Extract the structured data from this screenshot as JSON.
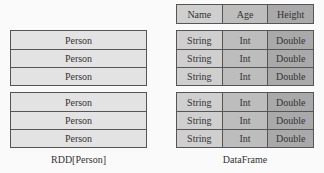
{
  "rdd": {
    "groups": [
      [
        "Person",
        "Person",
        "Person"
      ],
      [
        "Person",
        "Person",
        "Person"
      ]
    ],
    "caption": "RDD[Person]"
  },
  "dataframe": {
    "header": [
      "Name",
      "Age",
      "Height"
    ],
    "groups": [
      [
        [
          "String",
          "Int",
          "Double"
        ],
        [
          "String",
          "Int",
          "Double"
        ],
        [
          "String",
          "Int",
          "Double"
        ]
      ],
      [
        [
          "String",
          "Int",
          "Double"
        ],
        [
          "String",
          "Int",
          "Double"
        ],
        [
          "String",
          "Int",
          "Double"
        ]
      ]
    ],
    "caption": "DataFrame"
  },
  "colors": {
    "person_fill": "#e3e3e3",
    "string_fill": "#cfcfcf",
    "int_fill": "#bdbdbd",
    "double_fill": "#a9a9a9",
    "border": "#555555"
  }
}
